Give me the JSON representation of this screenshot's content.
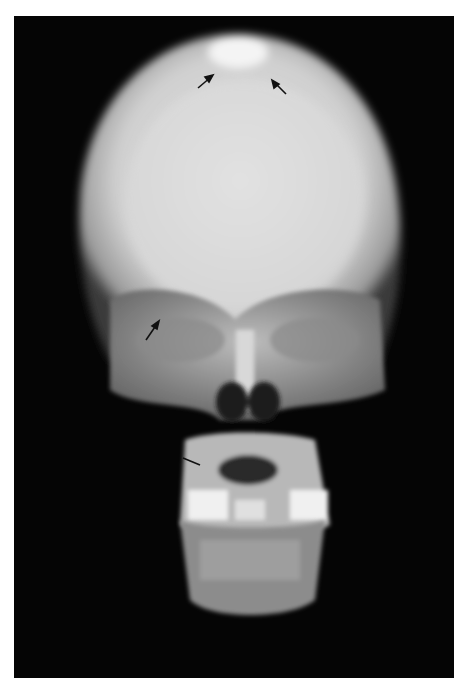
{
  "image": {
    "description": "Frontal (AP) radiograph of a child's skull",
    "background_color": "#ffffff",
    "film_color": "#050505",
    "annotations": [
      {
        "type": "arrow",
        "label": "arrow-vertex-left",
        "x": 205,
        "y": 80
      },
      {
        "type": "arrow",
        "label": "arrow-vertex-right",
        "x": 280,
        "y": 88
      },
      {
        "type": "arrow",
        "label": "arrow-orbit-left",
        "x": 152,
        "y": 332
      },
      {
        "type": "arrow",
        "label": "arrow-maxilla-left",
        "x": 195,
        "y": 462
      }
    ]
  }
}
